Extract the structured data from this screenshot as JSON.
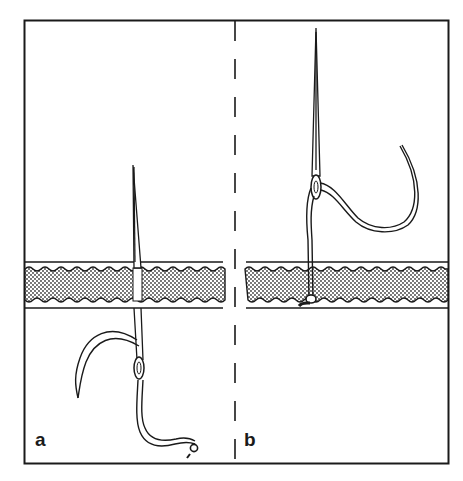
{
  "figure": {
    "colors": {
      "ink": "#1a1a1a",
      "background": "#ffffff",
      "fabric_fill": "#c8c8c8"
    },
    "panels": [
      {
        "id": "a",
        "label": "a",
        "caption": "Needle pushed up through fabric with thread looped below"
      },
      {
        "id": "b",
        "label": "b",
        "caption": "Needle pulled above fabric, thread knotted at underside"
      }
    ],
    "divider": {
      "style": "dashed",
      "orientation": "vertical"
    }
  }
}
